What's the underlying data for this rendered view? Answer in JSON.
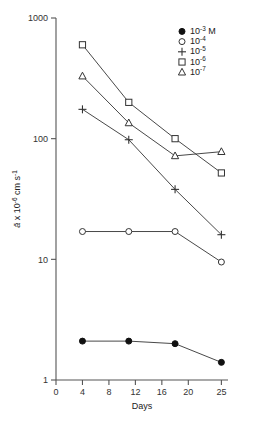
{
  "chart_data": {
    "type": "line",
    "title": "",
    "xlabel": "Days",
    "ylabel": "ā x 10⁻⁶ cm s⁻¹",
    "ylabel_parts": {
      "symbol": "ā",
      "multiplier": " x 10",
      "mult_exp": "-6",
      "unit": " cm s",
      "unit_exp": "-1"
    },
    "x": [
      4,
      11,
      18,
      25
    ],
    "xlim": [
      0,
      26
    ],
    "ylim": [
      1,
      1000
    ],
    "yscale": "log",
    "xticks": [
      0,
      4,
      8,
      12,
      16,
      20,
      25
    ],
    "xticklabels": [
      "0",
      "4",
      "8",
      "12",
      "16",
      "20",
      "25"
    ],
    "yticks": [
      1,
      10,
      100,
      1000
    ],
    "yticklabels": [
      "1",
      "10",
      "100",
      "1000"
    ],
    "grid": false,
    "legend_position": "top-right",
    "series": [
      {
        "name": "10⁻³ M",
        "label_base": "10",
        "label_exp": "-3",
        "label_suffix": " M",
        "marker": "filled-circle",
        "values": [
          2.1,
          2.1,
          2.0,
          1.4
        ]
      },
      {
        "name": "10⁻⁴",
        "label_base": "10",
        "label_exp": "-4",
        "label_suffix": "",
        "marker": "open-circle",
        "values": [
          17,
          17,
          17,
          9.5
        ]
      },
      {
        "name": "10⁻⁵",
        "label_base": "10",
        "label_exp": "-5",
        "label_suffix": "",
        "marker": "plus",
        "values": [
          175,
          98,
          38,
          16
        ]
      },
      {
        "name": "10⁻⁶",
        "label_base": "10",
        "label_exp": "-6",
        "label_suffix": "",
        "marker": "open-square",
        "values": [
          600,
          200,
          100,
          52
        ]
      },
      {
        "name": "10⁻⁷",
        "label_base": "10",
        "label_exp": "-7",
        "label_suffix": "",
        "marker": "open-triangle",
        "values": [
          330,
          135,
          72,
          78
        ]
      }
    ]
  }
}
